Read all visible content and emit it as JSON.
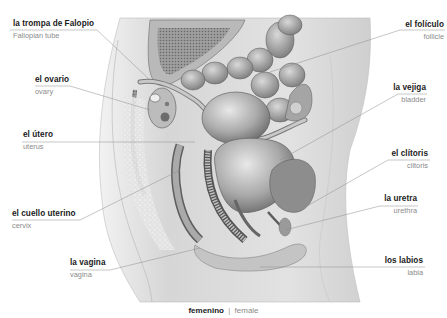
{
  "diagram": {
    "title_es": "femenino",
    "title_separator": "|",
    "title_en": "female",
    "style": "grayscale anatomical illustration, sagittal section of female pelvis",
    "colors": {
      "label_primary": "#1a1a1a",
      "label_secondary": "#8a8a8a",
      "leader_line": "#8c8c8c",
      "skin": "#dcdcdc",
      "organ_dark": "#6e6e6e",
      "organ_light": "#bdbdbd",
      "background": "#ffffff"
    },
    "labels": [
      {
        "id": "fallopian-tube",
        "es": "la trompa de Falopio",
        "en": "Fallopian tube",
        "side": "left"
      },
      {
        "id": "ovary",
        "es": "el ovario",
        "en": "ovary",
        "side": "left"
      },
      {
        "id": "uterus",
        "es": "el útero",
        "en": "uterus",
        "side": "left"
      },
      {
        "id": "cervix",
        "es": "el cuello uterino",
        "en": "cervix",
        "side": "left"
      },
      {
        "id": "vagina",
        "es": "la vagina",
        "en": "vagina",
        "side": "left"
      },
      {
        "id": "follicle",
        "es": "el folículo",
        "en": "follicle",
        "side": "right"
      },
      {
        "id": "bladder",
        "es": "la vejiga",
        "en": "bladder",
        "side": "right"
      },
      {
        "id": "clitoris",
        "es": "el clítoris",
        "en": "clitoris",
        "side": "right"
      },
      {
        "id": "urethra",
        "es": "la uretra",
        "en": "urethra",
        "side": "right"
      },
      {
        "id": "labia",
        "es": "los labios",
        "en": "labia",
        "side": "right"
      }
    ]
  }
}
